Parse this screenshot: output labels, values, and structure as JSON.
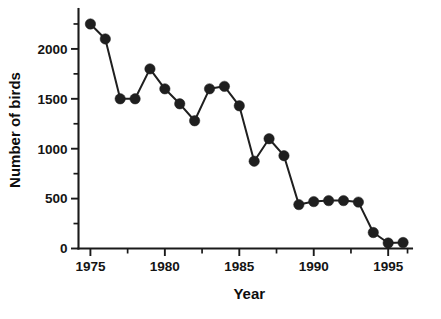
{
  "chart_data": {
    "type": "line",
    "title": "",
    "xlabel": "Year",
    "ylabel": "Number of birds",
    "xlim": [
      1974.2,
      1996.6
    ],
    "ylim": [
      0,
      2400
    ],
    "grid": false,
    "legend": null,
    "marker": "filled-circle",
    "x": [
      1975,
      1976,
      1977,
      1978,
      1979,
      1980,
      1981,
      1982,
      1983,
      1984,
      1985,
      1986,
      1987,
      1988,
      1989,
      1990,
      1991,
      1992,
      1993,
      1994,
      1995,
      1996
    ],
    "values": [
      2250,
      2100,
      1500,
      1500,
      1800,
      1600,
      1450,
      1280,
      1600,
      1625,
      1430,
      875,
      1100,
      930,
      440,
      470,
      480,
      480,
      465,
      160,
      55,
      60
    ],
    "series": [
      {
        "name": "Number of birds",
        "values": [
          2250,
          2100,
          1500,
          1500,
          1800,
          1600,
          1450,
          1280,
          1600,
          1625,
          1430,
          875,
          1100,
          930,
          440,
          470,
          480,
          480,
          465,
          160,
          55,
          60
        ]
      }
    ],
    "y_ticks": [
      0,
      500,
      1000,
      1500,
      2000
    ],
    "y_ticklabels": [
      "0",
      "500",
      "1000",
      "1500",
      "2000"
    ],
    "y_minor_ticks": [
      250,
      750,
      1250,
      1750,
      2250
    ],
    "x_ticks": [
      1975,
      1980,
      1985,
      1990,
      1995
    ],
    "x_ticklabels": [
      "1975",
      "1980",
      "1985",
      "1990",
      "1995"
    ],
    "x_minor_ticks": [
      1977.5,
      1982.5,
      1987.5,
      1992.5,
      1996.3
    ],
    "colors": {
      "line": "#1f1f1f",
      "marker": "#1f1f1f",
      "axis": "#1a1a1a",
      "text": "#111111",
      "background": "#ffffff"
    }
  }
}
